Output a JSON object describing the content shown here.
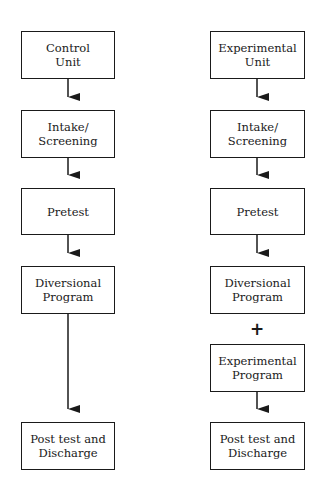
{
  "diagram": {
    "type": "flowchart",
    "columns": [
      {
        "id": "control",
        "steps": [
          {
            "id": "control-unit",
            "label": "Control\nUnit"
          },
          {
            "id": "intake-screening",
            "label": "Intake/\nScreening"
          },
          {
            "id": "pretest",
            "label": "Pretest"
          },
          {
            "id": "diversional-program",
            "label": "Diversional\nProgram"
          },
          {
            "id": "post-test-discharge",
            "label": "Post test and\nDischarge"
          }
        ]
      },
      {
        "id": "experimental",
        "steps": [
          {
            "id": "experimental-unit",
            "label": "Experimental\nUnit"
          },
          {
            "id": "intake-screening",
            "label": "Intake/\nScreening"
          },
          {
            "id": "pretest",
            "label": "Pretest"
          },
          {
            "id": "diversional-program",
            "label": "Diversional\nProgram"
          },
          {
            "id": "experimental-program",
            "label": "Experimental\nProgram"
          },
          {
            "id": "post-test-discharge",
            "label": "Post test and\nDischarge"
          }
        ],
        "combine_symbol": "+"
      }
    ],
    "colors": {
      "line": "#1a1a1a",
      "background": "#ffffff"
    }
  }
}
